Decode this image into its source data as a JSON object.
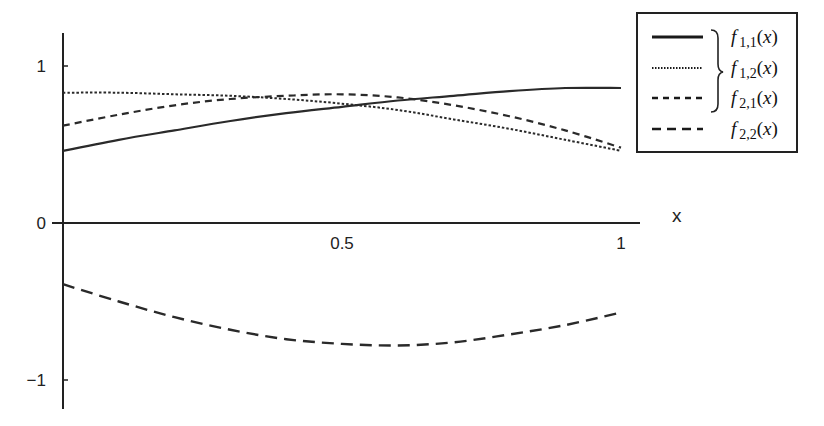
{
  "chart_data": {
    "type": "line",
    "title": "",
    "xlabel": "x",
    "ylabel": "",
    "xlim": [
      0,
      1
    ],
    "ylim": [
      -1.2,
      1.2
    ],
    "grid": false,
    "legend_position": "upper right",
    "x_ticks": [
      {
        "value": 0.5,
        "label": "0.5"
      },
      {
        "value": 1,
        "label": "1"
      }
    ],
    "y_ticks": [
      {
        "value": 1,
        "label": "1"
      },
      {
        "value": 0,
        "label": "0"
      },
      {
        "value": -1,
        "label": "−1"
      }
    ],
    "x": [
      0,
      0.1,
      0.2,
      0.3,
      0.4,
      0.5,
      0.6,
      0.7,
      0.8,
      0.9,
      1.0
    ],
    "series": [
      {
        "name": "f_{1,1}(x)",
        "label_base": "f",
        "label_sub": "1,1",
        "style": "solid",
        "values": [
          0.46,
          0.53,
          0.59,
          0.65,
          0.7,
          0.74,
          0.78,
          0.81,
          0.84,
          0.86,
          0.86
        ]
      },
      {
        "name": "f_{1,2}(x)",
        "label_base": "f",
        "label_sub": "1,2",
        "style": "dotted",
        "values": [
          0.83,
          0.83,
          0.82,
          0.81,
          0.79,
          0.76,
          0.72,
          0.66,
          0.6,
          0.53,
          0.46
        ]
      },
      {
        "name": "f_{2,1}(x)",
        "label_base": "f",
        "label_sub": "2,1",
        "style": "short-dash",
        "values": [
          0.62,
          0.69,
          0.75,
          0.79,
          0.81,
          0.82,
          0.8,
          0.75,
          0.68,
          0.59,
          0.48
        ]
      },
      {
        "name": "f_{2,2}(x)",
        "label_base": "f",
        "label_sub": "2,2",
        "style": "long-dash",
        "values": [
          -0.39,
          -0.5,
          -0.6,
          -0.68,
          -0.74,
          -0.77,
          -0.78,
          -0.76,
          -0.71,
          -0.65,
          -0.57
        ]
      }
    ],
    "annotations": [
      {
        "type": "brace",
        "groups": [
          "f_{1,1}(x)",
          "f_{1,2}(x)",
          "f_{2,1}(x)"
        ]
      }
    ]
  }
}
